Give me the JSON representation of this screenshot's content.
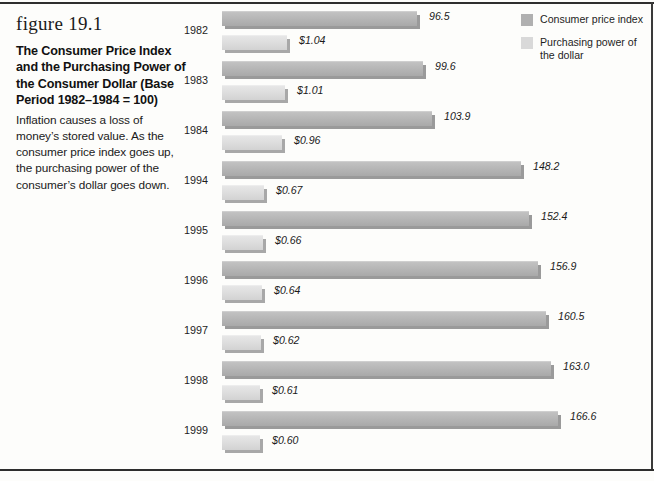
{
  "figure": {
    "number": "figure 19.1",
    "title": "The Consumer Price Index and the Purchasing Power of the Consumer Dollar (Base Period 1982–1984 = 100)",
    "description": "Inflation causes a loss of money’s stored value. As the consumer price index goes up, the purchasing power of the consumer’s dollar goes down."
  },
  "legend": {
    "items": [
      {
        "label": "Consumer price index",
        "color": "#b0b0b0",
        "swatch": "cpi"
      },
      {
        "label": "Purchasing power of the dollar",
        "color": "#d9d9d9",
        "swatch": "ppd"
      }
    ]
  },
  "chart_data": {
    "type": "bar",
    "orientation": "horizontal",
    "title": "The Consumer Price Index and the Purchasing Power of the Consumer Dollar (Base Period 1982–1984 = 100)",
    "xlabel": "",
    "ylabel": "",
    "grid": false,
    "legend_position": "top-right",
    "categories": [
      "1982",
      "1983",
      "1984",
      "1994",
      "1995",
      "1996",
      "1997",
      "1998",
      "1999"
    ],
    "series": [
      {
        "name": "Consumer price index",
        "color": "#b0b0b0",
        "values": [
          96.5,
          99.6,
          103.9,
          148.2,
          152.4,
          156.9,
          160.5,
          163.0,
          166.6
        ],
        "labels": [
          "96.5",
          "99.6",
          "103.9",
          "148.2",
          "152.4",
          "156.9",
          "160.5",
          "163.0",
          "166.6"
        ],
        "axis_max": 180
      },
      {
        "name": "Purchasing power of the dollar",
        "color": "#d9d9d9",
        "values": [
          1.04,
          1.01,
          0.96,
          0.67,
          0.66,
          0.64,
          0.62,
          0.61,
          0.6
        ],
        "labels": [
          "$1.04",
          "$1.01",
          "$0.96",
          "$0.67",
          "$0.66",
          "$0.64",
          "$0.62",
          "$0.61",
          "$0.60"
        ],
        "axis_max": 1.2
      }
    ],
    "rows": [
      {
        "year": "1982",
        "cpi": 96.5,
        "cpi_label": "96.5",
        "dollar": 1.04,
        "dollar_label": "$1.04"
      },
      {
        "year": "1983",
        "cpi": 99.6,
        "cpi_label": "99.6",
        "dollar": 1.01,
        "dollar_label": "$1.01"
      },
      {
        "year": "1984",
        "cpi": 103.9,
        "cpi_label": "103.9",
        "dollar": 0.96,
        "dollar_label": "$0.96"
      },
      {
        "year": "1994",
        "cpi": 148.2,
        "cpi_label": "148.2",
        "dollar": 0.67,
        "dollar_label": "$0.67"
      },
      {
        "year": "1995",
        "cpi": 152.4,
        "cpi_label": "152.4",
        "dollar": 0.66,
        "dollar_label": "$0.66"
      },
      {
        "year": "1996",
        "cpi": 156.9,
        "cpi_label": "156.9",
        "dollar": 0.64,
        "dollar_label": "$0.64"
      },
      {
        "year": "1997",
        "cpi": 160.5,
        "cpi_label": "160.5",
        "dollar": 0.62,
        "dollar_label": "$0.62"
      },
      {
        "year": "1998",
        "cpi": 163.0,
        "cpi_label": "163.0",
        "dollar": 0.61,
        "dollar_label": "$0.61"
      },
      {
        "year": "1999",
        "cpi": 166.6,
        "cpi_label": "166.6",
        "dollar": 0.6,
        "dollar_label": "$0.60"
      }
    ]
  }
}
